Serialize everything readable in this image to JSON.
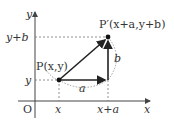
{
  "diagram": {
    "type": "coordinate-translation",
    "axes": {
      "x_label": "x",
      "y_label": "y",
      "origin_label": "O"
    },
    "points": {
      "P": {
        "label": "P(x,y)"
      },
      "P_prime": {
        "label": "P′(x+a,y+b)"
      }
    },
    "x_ticks": [
      "x",
      "x+a"
    ],
    "y_ticks": [
      "y+b",
      "y"
    ],
    "segments": {
      "horizontal": "a",
      "vertical": "b"
    },
    "colors": {
      "line": "#333333",
      "dashed": "#777777"
    }
  }
}
